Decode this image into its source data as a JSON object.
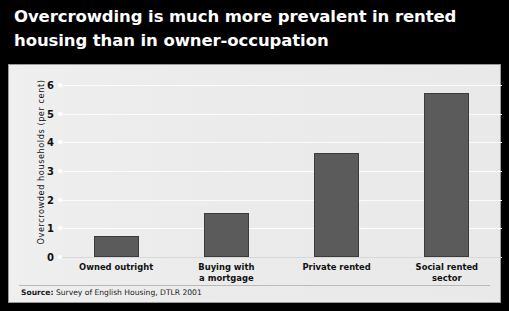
{
  "title": "Overcrowding is much more prevalent in rented\nhousing than in owner-occupation",
  "source": {
    "lead": "Source:",
    "text": " Survey of English Housing, DTLR 2001"
  },
  "colors": {
    "title_band": "#000000",
    "title_text": "#ffffff",
    "panel_background": "#eeeeee",
    "panel_border": "#9a9a9a",
    "bar_fill": "#5b5b5b",
    "bar_edge": "#3c3c3c",
    "gridline": "#fbfbfb",
    "axis_text": "#111111"
  },
  "chart_data": {
    "type": "bar",
    "title": "Overcrowding is much more prevalent in rented housing than in owner-occupation",
    "xlabel": "",
    "ylabel": "Overcrowded households (per cent)",
    "categories": [
      "Owned outright",
      "Buying with\na mortgage",
      "Private rented",
      "Social rented\nsector"
    ],
    "values": [
      0.73,
      1.55,
      3.62,
      5.72
    ],
    "ylim": [
      0,
      6
    ],
    "yticks": [
      0,
      1,
      2,
      3,
      4,
      5,
      6
    ],
    "ytick_labels": [
      "0",
      "1",
      "2",
      "3",
      "4",
      "5",
      "6"
    ],
    "grid": true,
    "legend": "none",
    "source": "Source: Survey of English Housing, DTLR 2001"
  }
}
